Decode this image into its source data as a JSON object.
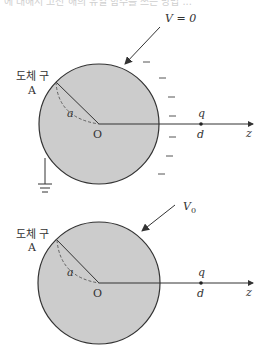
{
  "cut_off_caption": "에 대해서 고전 해의 유일 함수를 쓰는 방법 ...",
  "colors": {
    "sphere_fill": "#cccccc",
    "stroke": "#333333",
    "background": "#ffffff"
  },
  "top_diagram": {
    "potential_label": "V = 0",
    "sphere_label_kr": "도체 구",
    "sphere_label_letter": "A",
    "radius_label": "a",
    "origin_label": "O",
    "charge_label": "q",
    "distance_label": "d",
    "axis_label": "z",
    "grounded": true,
    "induced_charges": [
      "−",
      "−",
      "−",
      "−",
      "−",
      "−",
      "−"
    ]
  },
  "bottom_diagram": {
    "potential_label": "V0",
    "potential_base": "V",
    "potential_sub": "0",
    "sphere_label_kr": "도체 구",
    "sphere_label_letter": "A",
    "radius_label": "a",
    "origin_label": "O",
    "charge_label": "q",
    "distance_label": "d",
    "axis_label": "z",
    "grounded": false
  }
}
